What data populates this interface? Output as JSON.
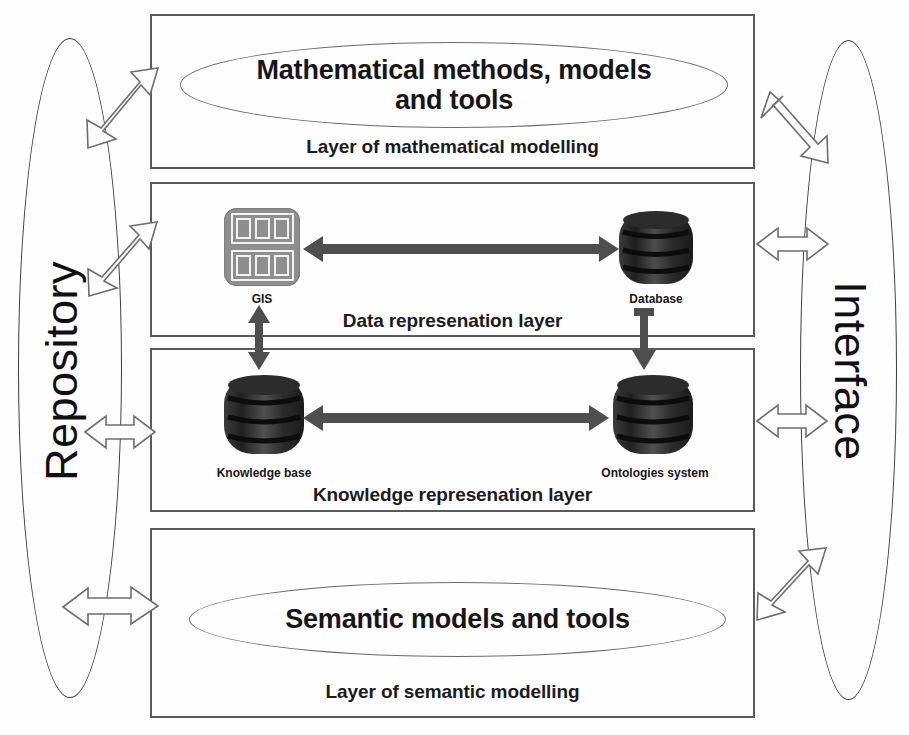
{
  "diagram": {
    "type": "block-diagram"
  },
  "side_nodes": {
    "left": {
      "label": "Repository",
      "name": "repository-ellipse"
    },
    "right": {
      "label": "Interface",
      "name": "interface-ellipse"
    }
  },
  "layers": [
    {
      "id": "mathematical-modelling",
      "caption": "Layer of mathematical modelling",
      "ellipse_label": "Mathematical methods, models and tools",
      "ellipse_line1": "Mathematical methods, models",
      "ellipse_line2": "and tools",
      "nodes": []
    },
    {
      "id": "data-representation",
      "caption": "Data represenation layer",
      "nodes": [
        {
          "id": "gis",
          "label": "GIS",
          "icon": "gis-grid-icon"
        },
        {
          "id": "database",
          "label": "Database",
          "icon": "database-cylinder-icon"
        }
      ]
    },
    {
      "id": "knowledge-representation",
      "caption": "Knowledge represenation layer",
      "nodes": [
        {
          "id": "knowledge-base",
          "label": "Knowledge base",
          "icon": "database-cylinder-icon"
        },
        {
          "id": "ontologies-system",
          "label": "Ontologies system",
          "icon": "database-cylinder-icon"
        }
      ]
    },
    {
      "id": "semantic-modelling",
      "caption": "Layer of semantic modelling",
      "ellipse_label": "Semantic models and tools",
      "nodes": []
    }
  ],
  "connectors": {
    "gis_database": {
      "name": "gis-database-arrow",
      "direction": "bidirectional"
    },
    "knowledge_ontologies": {
      "name": "knowledge-ontologies-arrow",
      "direction": "bidirectional"
    },
    "gis_knowledge": {
      "name": "gis-knowledge-base-arrow",
      "direction": "bidirectional"
    },
    "database_ontologies": {
      "name": "database-ontologies-arrow",
      "direction": "down"
    },
    "repository_links": [
      {
        "name": "repository-math-layer-arrow",
        "direction": "bidirectional"
      },
      {
        "name": "repository-data-layer-arrow",
        "direction": "bidirectional"
      },
      {
        "name": "repository-knowledge-layer-arrow",
        "direction": "bidirectional"
      },
      {
        "name": "repository-semantic-layer-arrow",
        "direction": "bidirectional"
      }
    ],
    "interface_links": [
      {
        "name": "interface-math-layer-arrow",
        "direction": "bidirectional"
      },
      {
        "name": "interface-data-layer-arrow",
        "direction": "bidirectional"
      },
      {
        "name": "interface-knowledge-layer-arrow",
        "direction": "bidirectional"
      },
      {
        "name": "interface-semantic-layer-arrow",
        "direction": "bidirectional"
      }
    ]
  },
  "colors": {
    "box_border": "#5a5a5a",
    "ellipse_border": "#6b6b6b",
    "gis_icon": "#8e8e8e",
    "cylinder_dark": "#2f2f2f",
    "arrow_solid": "#4e4e4e",
    "arrow_outline": "#6d6d6d",
    "text": "#161616",
    "background": "#ffffff"
  }
}
